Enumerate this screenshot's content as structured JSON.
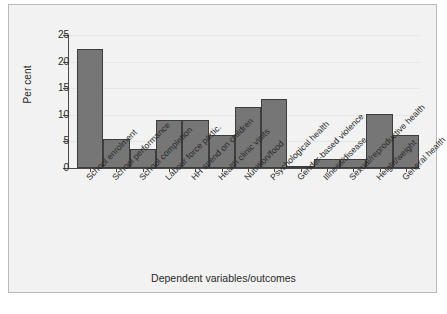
{
  "chart_data": {
    "type": "bar",
    "title": "",
    "xlabel": "Dependent variables/outcomes",
    "ylabel": "Per cent",
    "ylim": [
      0,
      25
    ],
    "yticks": [
      0,
      5,
      10,
      15,
      20,
      25
    ],
    "ytick_labels": [
      "0",
      "5",
      "10",
      "15",
      "20",
      "25"
    ],
    "grid": true,
    "legend": "none",
    "bar_color": "#767676",
    "bar_edge_color": "#3d3d3d",
    "plot_background": "#f2f2f2",
    "categories": [
      "School enrolment",
      "School performance",
      "School completion",
      "Labour force partic.",
      "HH spend on children",
      "Health clinic visits",
      "Nutrition/food",
      "Psychological health",
      "Gender-based violence",
      "Illness/disease",
      "Sexual/reproductive health",
      "Height/weight",
      "General health"
    ],
    "values": [
      22.4,
      5.5,
      3.6,
      9.0,
      9.0,
      6.2,
      11.4,
      13.0,
      0.3,
      1.7,
      1.7,
      10.1,
      6.2
    ]
  }
}
